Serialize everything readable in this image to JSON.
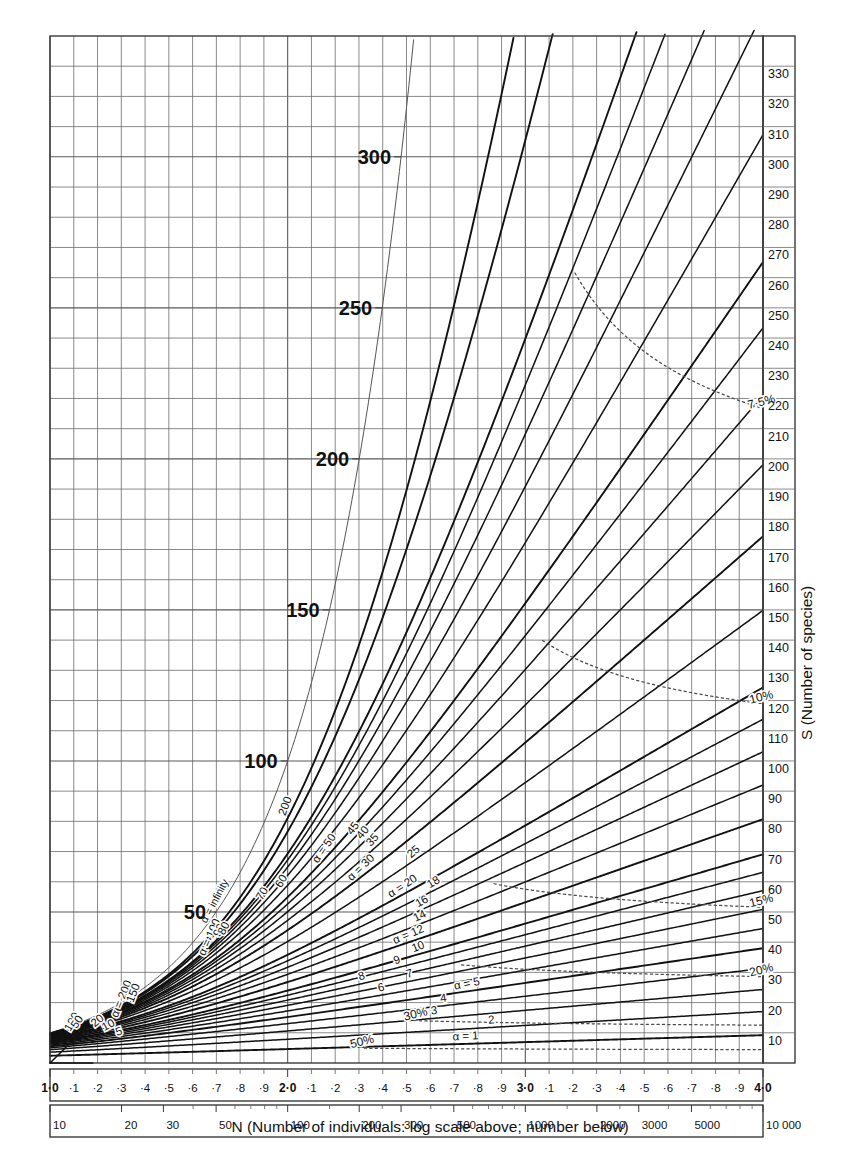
{
  "figure": {
    "type": "nomogram",
    "y_axis_title": "S (Number of species)",
    "x_axis_title": "N (Number of individuals: log scale above; number below)"
  },
  "axes": {
    "x_log_ticks": [
      {
        "label": "1·0",
        "value": 1.0,
        "bold": true
      },
      {
        "label": "·1",
        "value": 1.1,
        "bold": false
      },
      {
        "label": "·2",
        "value": 1.2,
        "bold": false
      },
      {
        "label": "·3",
        "value": 1.3,
        "bold": false
      },
      {
        "label": "·4",
        "value": 1.4,
        "bold": false
      },
      {
        "label": "·5",
        "value": 1.5,
        "bold": false
      },
      {
        "label": "·6",
        "value": 1.6,
        "bold": false
      },
      {
        "label": "·7",
        "value": 1.7,
        "bold": false
      },
      {
        "label": "·8",
        "value": 1.8,
        "bold": false
      },
      {
        "label": "·9",
        "value": 1.9,
        "bold": false
      },
      {
        "label": "2·0",
        "value": 2.0,
        "bold": true
      },
      {
        "label": "·1",
        "value": 2.1,
        "bold": false
      },
      {
        "label": "·2",
        "value": 2.2,
        "bold": false
      },
      {
        "label": "·3",
        "value": 2.3,
        "bold": false
      },
      {
        "label": "·4",
        "value": 2.4,
        "bold": false
      },
      {
        "label": "·5",
        "value": 2.5,
        "bold": false
      },
      {
        "label": "·6",
        "value": 2.6,
        "bold": false
      },
      {
        "label": "·7",
        "value": 2.7,
        "bold": false
      },
      {
        "label": "·8",
        "value": 2.8,
        "bold": false
      },
      {
        "label": "·9",
        "value": 2.9,
        "bold": false
      },
      {
        "label": "3·0",
        "value": 3.0,
        "bold": true
      },
      {
        "label": "·1",
        "value": 3.1,
        "bold": false
      },
      {
        "label": "·2",
        "value": 3.2,
        "bold": false
      },
      {
        "label": "·3",
        "value": 3.3,
        "bold": false
      },
      {
        "label": "·4",
        "value": 3.4,
        "bold": false
      },
      {
        "label": "·5",
        "value": 3.5,
        "bold": false
      },
      {
        "label": "·6",
        "value": 3.6,
        "bold": false
      },
      {
        "label": "·7",
        "value": 3.7,
        "bold": false
      },
      {
        "label": "·8",
        "value": 3.8,
        "bold": false
      },
      {
        "label": "·9",
        "value": 3.9,
        "bold": false
      },
      {
        "label": "4·0",
        "value": 4.0,
        "bold": true
      }
    ],
    "x_number_ticks": [
      {
        "label": "10",
        "value": 10
      },
      {
        "label": "20",
        "value": 20
      },
      {
        "label": "30",
        "value": 30
      },
      {
        "label": "50",
        "value": 50
      },
      {
        "label": "100",
        "value": 100
      },
      {
        "label": "200",
        "value": 200
      },
      {
        "label": "300",
        "value": 300
      },
      {
        "label": "500",
        "value": 500
      },
      {
        "label": "1000",
        "value": 1000
      },
      {
        "label": "2000",
        "value": 2000
      },
      {
        "label": "3000",
        "value": 3000
      },
      {
        "label": "5000",
        "value": 5000
      },
      {
        "label": "10 000",
        "value": 10000
      }
    ],
    "x_minor_number_ticks": [
      40,
      60,
      70,
      80,
      90,
      150,
      250,
      400,
      600,
      700,
      800,
      900,
      1500,
      2500,
      4000,
      6000,
      7000,
      8000,
      9000
    ],
    "y_range": [
      0,
      340
    ],
    "y_right_ticks": [
      10,
      20,
      30,
      40,
      50,
      60,
      70,
      80,
      90,
      100,
      110,
      120,
      130,
      140,
      150,
      160,
      170,
      180,
      190,
      200,
      210,
      220,
      230,
      240,
      250,
      260,
      270,
      280,
      290,
      300,
      310,
      320,
      330
    ],
    "y_left_ticks": [
      {
        "label": "50",
        "value": 50
      },
      {
        "label": "100",
        "value": 100
      },
      {
        "label": "150",
        "value": 150
      },
      {
        "label": "200",
        "value": 200
      },
      {
        "label": "250",
        "value": 250
      },
      {
        "label": "300",
        "value": 300
      }
    ]
  },
  "chart_data": {
    "type": "line",
    "title": "",
    "xlabel": "N (Number of individuals: log scale above; number below)",
    "ylabel": "S (Number of species)",
    "xlim": [
      1.0,
      4.0
    ],
    "ylim": [
      0,
      340
    ],
    "grid": true,
    "model": "S = alpha * ln(1 + N/alpha)",
    "alpha_curves": [
      {
        "label": "α = infinity",
        "alpha": 1000000000.0,
        "label_pos_x": 1.72,
        "rotate": -62,
        "major": false
      },
      {
        "label": "200",
        "alpha": 200,
        "label_pos_x": 2.02,
        "rotate": -70,
        "major": true
      },
      {
        "label": "α = 200",
        "alpha": 200,
        "label_pos_x": 1.33,
        "rotate": -68,
        "major": true,
        "dup": true
      },
      {
        "label": "150",
        "alpha": 150,
        "label_pos_x": 1.38,
        "rotate": -68,
        "major": true
      },
      {
        "label": "α = 100",
        "alpha": 100,
        "label_pos_x": 1.7,
        "rotate": -66,
        "major": true
      },
      {
        "label": "100",
        "alpha": 100,
        "label_pos_x": 1.12,
        "rotate": -60,
        "major": true,
        "dup": true
      },
      {
        "label": "90",
        "alpha": 90,
        "label_pos_x": 1.74,
        "rotate": -64,
        "major": false
      },
      {
        "label": "80",
        "alpha": 80,
        "label_pos_x": 1.76,
        "rotate": -62,
        "major": false
      },
      {
        "label": "70",
        "alpha": 70,
        "label_pos_x": 1.92,
        "rotate": -60,
        "major": false
      },
      {
        "label": "60",
        "alpha": 60,
        "label_pos_x": 2.0,
        "rotate": -58,
        "major": false
      },
      {
        "label": "α = 50",
        "alpha": 50,
        "label_pos_x": 2.18,
        "rotate": -55,
        "major": true
      },
      {
        "label": "50",
        "alpha": 50,
        "label_pos_x": 1.14,
        "rotate": -56,
        "major": true,
        "dup": true
      },
      {
        "label": "45",
        "alpha": 45,
        "label_pos_x": 2.3,
        "rotate": -52,
        "major": false
      },
      {
        "label": "40",
        "alpha": 40,
        "label_pos_x": 2.34,
        "rotate": -50,
        "major": false
      },
      {
        "label": "35",
        "alpha": 35,
        "label_pos_x": 2.38,
        "rotate": -47,
        "major": false
      },
      {
        "label": "α = 30",
        "alpha": 30,
        "label_pos_x": 2.33,
        "rotate": -44,
        "major": true
      },
      {
        "label": "25",
        "alpha": 25,
        "label_pos_x": 2.55,
        "rotate": -40,
        "major": false
      },
      {
        "label": "α = 20",
        "alpha": 20,
        "label_pos_x": 2.5,
        "rotate": -33,
        "major": true
      },
      {
        "label": "20",
        "alpha": 20,
        "label_pos_x": 1.22,
        "rotate": -40,
        "major": true,
        "dup": true
      },
      {
        "label": "18",
        "alpha": 18,
        "label_pos_x": 2.63,
        "rotate": -31,
        "major": false
      },
      {
        "label": "16",
        "alpha": 16,
        "label_pos_x": 2.58,
        "rotate": -29,
        "major": false
      },
      {
        "label": "14",
        "alpha": 14,
        "label_pos_x": 2.57,
        "rotate": -26,
        "major": false
      },
      {
        "label": "α = 12",
        "alpha": 12,
        "label_pos_x": 2.52,
        "rotate": -23,
        "major": true
      },
      {
        "label": "10",
        "alpha": 10,
        "label_pos_x": 2.56,
        "rotate": -21,
        "major": true
      },
      {
        "label": "10",
        "alpha": 10,
        "label_pos_x": 1.26,
        "rotate": -28,
        "major": true,
        "dup": true
      },
      {
        "label": "9",
        "alpha": 9,
        "label_pos_x": 2.47,
        "rotate": -19,
        "major": false
      },
      {
        "label": "8",
        "alpha": 8,
        "label_pos_x": 2.32,
        "rotate": -17,
        "major": false
      },
      {
        "label": "7",
        "alpha": 7,
        "label_pos_x": 2.52,
        "rotate": -15,
        "major": false
      },
      {
        "label": "6",
        "alpha": 6,
        "label_pos_x": 2.4,
        "rotate": -13,
        "major": false
      },
      {
        "label": "α = 5",
        "alpha": 5,
        "label_pos_x": 2.76,
        "rotate": -11,
        "major": true
      },
      {
        "label": "5",
        "alpha": 5,
        "label_pos_x": 1.3,
        "rotate": -18,
        "major": true,
        "dup": true
      },
      {
        "label": "4",
        "alpha": 4,
        "label_pos_x": 2.66,
        "rotate": -9,
        "major": false
      },
      {
        "label": "3",
        "alpha": 3,
        "label_pos_x": 2.62,
        "rotate": -7,
        "major": false
      },
      {
        "label": "2",
        "alpha": 2,
        "label_pos_x": 2.86,
        "rotate": -5,
        "major": false
      },
      {
        "label": "α = 1",
        "alpha": 1,
        "label_pos_x": 2.75,
        "rotate": -3,
        "major": true
      }
    ],
    "percent_curves": [
      {
        "label": "3%",
        "percent": 3,
        "label_pos_y": 232
      },
      {
        "label": "4%",
        "percent": 4,
        "label_pos_y": 92
      },
      {
        "label": "5%",
        "percent": 5,
        "label_pos_y": 97
      },
      {
        "label": "5%",
        "percent": 5,
        "label_pos_y": 62,
        "dup": true
      },
      {
        "label": "7·5%",
        "percent": 7.5,
        "label_pos_y": 47
      },
      {
        "label": "10%",
        "percent": 10,
        "label_pos_y": 33
      },
      {
        "label": "15%",
        "percent": 15,
        "label_pos_y": 26
      },
      {
        "label": "20%",
        "percent": 20,
        "label_pos_y": 21
      },
      {
        "label": "30%",
        "percent": 30,
        "label_pos_y": 15
      },
      {
        "label": "50%",
        "percent": 50,
        "label_pos_y": 9
      }
    ]
  }
}
